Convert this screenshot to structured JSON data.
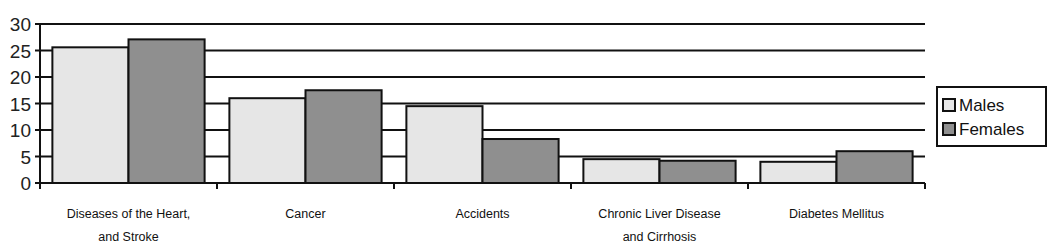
{
  "chart_data": {
    "type": "bar",
    "title": "",
    "xlabel": "",
    "ylabel": "",
    "ylim": [
      0,
      30
    ],
    "yticks": [
      0,
      5,
      10,
      15,
      20,
      25,
      30
    ],
    "grid": true,
    "legend_position": "right",
    "categories": [
      [
        "Diseases of the Heart,",
        "and Stroke"
      ],
      [
        "Cancer"
      ],
      [
        "Accidents"
      ],
      [
        "Chronic Liver Disease",
        "and Cirrhosis"
      ],
      [
        "Diabetes Mellitus"
      ]
    ],
    "series": [
      {
        "name": "Males",
        "color": "#e6e6e6",
        "values": [
          25.6,
          16.0,
          14.5,
          4.5,
          4.0
        ]
      },
      {
        "name": "Females",
        "color": "#8f8f8f",
        "values": [
          27.1,
          17.5,
          8.3,
          4.2,
          6.0
        ]
      }
    ]
  },
  "legend": {
    "items": [
      {
        "label": "Males",
        "color": "#e6e6e6"
      },
      {
        "label": "Females",
        "color": "#8f8f8f"
      }
    ]
  },
  "colors": {
    "axis": "#111111",
    "grid": "#111111",
    "males": "#e6e6e6",
    "females": "#8f8f8f"
  }
}
